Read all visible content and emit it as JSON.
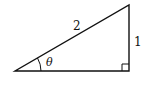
{
  "diagram": {
    "type": "right-triangle",
    "labels": {
      "hypotenuse": "2",
      "opposite": "1",
      "angle": "θ"
    },
    "vertices": {
      "left": [
        15,
        71
      ],
      "right_angle": [
        129,
        71
      ],
      "top": [
        129,
        5
      ]
    },
    "colors": {
      "stroke": "#111111",
      "background": "#ffffff"
    }
  }
}
